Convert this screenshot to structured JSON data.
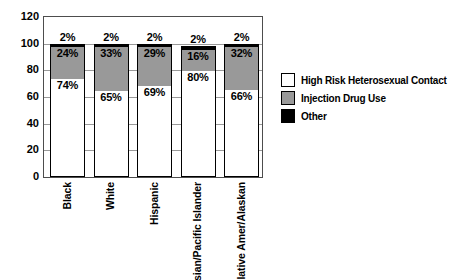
{
  "chart_data": {
    "type": "bar",
    "stacked": true,
    "title": "",
    "xlabel": "",
    "ylabel": "",
    "categories": [
      "Black",
      "White",
      "Hispanic",
      "sian/Pacific Islander",
      "lative Amer/Alaskan"
    ],
    "series": [
      {
        "name": "High Risk Heterosexual Contact",
        "color": "#ffffff",
        "values": [
          74,
          65,
          69,
          80,
          66
        ]
      },
      {
        "name": "Injection Drug Use",
        "color": "#999999",
        "values": [
          24,
          33,
          29,
          16,
          32
        ]
      },
      {
        "name": "Other",
        "color": "#000000",
        "values": [
          2,
          2,
          2,
          2,
          2
        ]
      }
    ],
    "value_labels": [
      [
        "74%",
        "65%",
        "69%",
        "80%",
        "66%"
      ],
      [
        "24%",
        "33%",
        "29%",
        "16%",
        "32%"
      ],
      [
        "2%",
        "2%",
        "2%",
        "2%",
        "2%"
      ]
    ],
    "ylim": [
      0,
      120
    ],
    "yticks": [
      0,
      20,
      40,
      60,
      80,
      100,
      120
    ],
    "grid": true,
    "legend_position": "right"
  },
  "colors": {
    "background": "#ffffff",
    "grid": "#999999",
    "frame": "#4d4d4d",
    "bar_border": "#000000",
    "text": "#000000"
  }
}
